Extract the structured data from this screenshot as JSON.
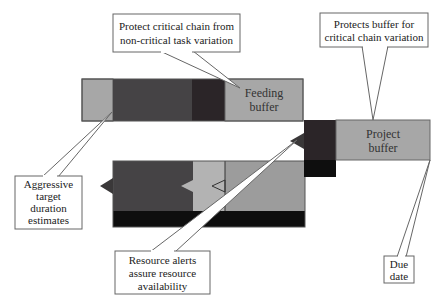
{
  "diagram": {
    "type": "critical-chain-schedule",
    "colors": {
      "light_grey": "#a7a7a7",
      "lighter_grey": "#b3b3b3",
      "mid_grey": "#9c9c9c",
      "dark_grey": "#454345",
      "darkest": "#2b2528",
      "black": "#0e0e0e",
      "outline": "#555555",
      "callout_border": "#666666"
    },
    "bars": {
      "feeding_chain": {
        "buffer_label_line1": "Feeding",
        "buffer_label_line2": "buffer"
      },
      "project": {
        "buffer_label_line1": "Project",
        "buffer_label_line2": "buffer"
      }
    },
    "callouts": [
      {
        "id": "protect-critical-chain",
        "lines": [
          "Protect critical chain from",
          "non-critical task variation"
        ]
      },
      {
        "id": "protects-buffer",
        "lines": [
          "Protects buffer for",
          "critical chain variation"
        ]
      },
      {
        "id": "aggressive-estimates",
        "lines": [
          "Aggressive",
          "target",
          "duration",
          "estimates"
        ]
      },
      {
        "id": "resource-alerts",
        "lines": [
          "Resource alerts",
          "assure resource",
          "availability"
        ]
      },
      {
        "id": "due-date",
        "lines": [
          "Due",
          "date"
        ]
      }
    ]
  }
}
